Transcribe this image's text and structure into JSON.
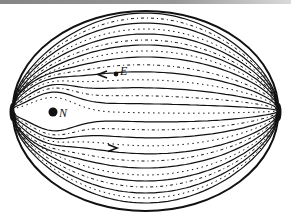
{
  "figure": {
    "width": 291,
    "height": 222,
    "ink_color": "#111111",
    "background": "#ffffff",
    "ellipse": {
      "cx": 145.5,
      "cy": 111,
      "rx": 133,
      "ry": 100
    },
    "poles": {
      "left": {
        "x": 12,
        "y": 112
      },
      "right": {
        "x": 279,
        "y": 112
      }
    },
    "points": [
      {
        "id": "E",
        "label": "E",
        "x": 116,
        "y": 74,
        "r": 2.4,
        "label_dx": 4,
        "label_dy": 1
      },
      {
        "id": "N",
        "label": "N",
        "x": 53,
        "y": 112,
        "r": 4.5,
        "label_dx": 6,
        "label_dy": 5
      }
    ],
    "arrows": [
      {
        "id": "arrow-upper",
        "x": 102,
        "y": 74.5,
        "direction": "left"
      },
      {
        "id": "arrow-lower",
        "x": 113,
        "y": 148,
        "direction": "right"
      }
    ],
    "solid_meridians_offsets": [
      -98,
      -88,
      -77,
      -66,
      -54,
      -40,
      -24,
      -8,
      10,
      26,
      42,
      57,
      70,
      82,
      92
    ],
    "dashed_meridians_offsets": [
      -93,
      -82,
      -71,
      -60,
      -47,
      -32,
      -16,
      1,
      18,
      34,
      50,
      64,
      76,
      87
    ],
    "distortion": {
      "source_x": 53,
      "source_y": 112,
      "strength": 14
    }
  }
}
